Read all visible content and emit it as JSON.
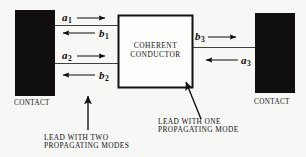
{
  "figure": {
    "background_color": "#f7f7f5",
    "ink_color": "#111111",
    "contact_fill": "#100f0e"
  },
  "contacts": {
    "left": {
      "label": "CONTACT"
    },
    "right": {
      "label": "CONTACT"
    }
  },
  "conductor": {
    "line1": "COHERENT",
    "line2": "CONDUCTOR"
  },
  "channels": {
    "a1": {
      "symbol": "a",
      "subscript": "1",
      "direction": "right"
    },
    "b1": {
      "symbol": "b",
      "subscript": "1",
      "direction": "left"
    },
    "a2": {
      "symbol": "a",
      "subscript": "2",
      "direction": "right"
    },
    "b2": {
      "symbol": "b",
      "subscript": "2",
      "direction": "left"
    },
    "b3": {
      "symbol": "b",
      "subscript": "3",
      "direction": "right"
    },
    "a3": {
      "symbol": "a",
      "subscript": "3",
      "direction": "left"
    }
  },
  "captions": {
    "left_lead": {
      "line1": "LEAD WITH TWO",
      "line2": "PROPAGATING MODES"
    },
    "right_lead": {
      "line1": "LEAD WITH ONE",
      "line2": "PROPAGATING MODE"
    }
  }
}
